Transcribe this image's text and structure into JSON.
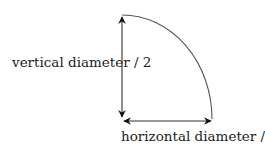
{
  "diagram": {
    "type": "quarter-ellipse",
    "labels": {
      "vertical": "vertical diameter / 2",
      "horizontal": "horizontal diameter / 2"
    },
    "colors": {
      "stroke": "#222222",
      "curve": "#555555",
      "text": "#222222"
    }
  }
}
